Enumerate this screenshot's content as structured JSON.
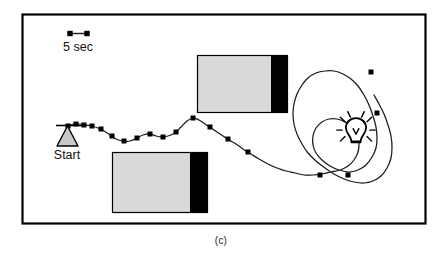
{
  "figure": {
    "caption": "(c)",
    "panel_border_color": "#000000",
    "background_color": "#ffffff"
  },
  "legend": {
    "scale_bar_label": "5 sec",
    "scale_bar_marker_shape": "square",
    "scale_bar_length_px": 19
  },
  "start_marker": {
    "label": "Start",
    "shape": "triangle",
    "fill_color": "#c9c9c9",
    "stroke_color": "#000000"
  },
  "light_source": {
    "icon_name": "light-bulb-icon",
    "ray_count": 8,
    "stroke_color": "#000000"
  },
  "barriers": [
    {
      "name": "upper-barrier",
      "x": 197,
      "y": 55,
      "width": 91,
      "height": 58,
      "panel_fill": "#d9d9d9",
      "dark_band_fill": "#000000",
      "dark_band_width": 17,
      "stroke_color": "#000000"
    },
    {
      "name": "lower-barrier",
      "x": 112,
      "y": 152,
      "width": 96,
      "height": 61,
      "panel_fill": "#d9d9d9",
      "dark_band_fill": "#000000",
      "dark_band_width": 18,
      "stroke_color": "#000000"
    }
  ],
  "chart_data": {
    "type": "line",
    "title": "",
    "xlabel": "",
    "ylabel": "",
    "grid": false,
    "legend_position": "top-left",
    "series": [
      {
        "name": "robot-trajectory",
        "stroke_color": "#1a1a1a",
        "marker_shape": "square",
        "marker_color": "#000000",
        "marker_size_px": 5,
        "path_points": [
          [
            68,
            126
          ],
          [
            74,
            124
          ],
          [
            80,
            124
          ],
          [
            86,
            125
          ],
          [
            92,
            126
          ],
          [
            98,
            128
          ],
          [
            104,
            131
          ],
          [
            110,
            135
          ],
          [
            116,
            139
          ],
          [
            123,
            141
          ],
          [
            130,
            141
          ],
          [
            137,
            138
          ],
          [
            143,
            135
          ],
          [
            150,
            134
          ],
          [
            156,
            136
          ],
          [
            162,
            137
          ],
          [
            168,
            136
          ],
          [
            175,
            133
          ],
          [
            181,
            127
          ],
          [
            187,
            121
          ],
          [
            193,
            118
          ],
          [
            199,
            120
          ],
          [
            205,
            124
          ],
          [
            211,
            128
          ],
          [
            217,
            132
          ],
          [
            223,
            136
          ],
          [
            229,
            140
          ],
          [
            236,
            144
          ],
          [
            243,
            149
          ],
          [
            251,
            154
          ],
          [
            259,
            159
          ],
          [
            268,
            164
          ],
          [
            277,
            168
          ],
          [
            286,
            171
          ],
          [
            295,
            173
          ],
          [
            304,
            175
          ],
          [
            313,
            175
          ],
          [
            322,
            174
          ],
          [
            331,
            172
          ],
          [
            340,
            170
          ],
          [
            348,
            166
          ],
          [
            354,
            160
          ],
          [
            358,
            152
          ],
          [
            359,
            143
          ],
          [
            357,
            134
          ],
          [
            352,
            127
          ],
          [
            345,
            122
          ],
          [
            337,
            119
          ],
          [
            329,
            119
          ],
          [
            322,
            122
          ],
          [
            316,
            128
          ],
          [
            313,
            136
          ],
          [
            313,
            145
          ],
          [
            316,
            153
          ],
          [
            322,
            160
          ],
          [
            330,
            166
          ],
          [
            339,
            170
          ],
          [
            349,
            172
          ],
          [
            358,
            170
          ],
          [
            366,
            165
          ],
          [
            372,
            157
          ],
          [
            376,
            148
          ],
          [
            377,
            138
          ],
          [
            376,
            127
          ],
          [
            373,
            116
          ],
          [
            369,
            105
          ],
          [
            364,
            95
          ],
          [
            358,
            86
          ],
          [
            351,
            79
          ],
          [
            343,
            74
          ],
          [
            334,
            71
          ],
          [
            325,
            71
          ],
          [
            316,
            73
          ],
          [
            308,
            78
          ],
          [
            302,
            85
          ],
          [
            297,
            94
          ],
          [
            294,
            104
          ],
          [
            293,
            114
          ],
          [
            294,
            124
          ],
          [
            297,
            134
          ],
          [
            302,
            144
          ],
          [
            308,
            153
          ],
          [
            316,
            161
          ],
          [
            325,
            168
          ],
          [
            334,
            174
          ],
          [
            344,
            179
          ],
          [
            354,
            182
          ],
          [
            364,
            183
          ],
          [
            373,
            181
          ],
          [
            381,
            176
          ],
          [
            387,
            168
          ],
          [
            391,
            158
          ],
          [
            392,
            147
          ],
          [
            391,
            136
          ],
          [
            388,
            125
          ],
          [
            384,
            114
          ],
          [
            379,
            104
          ],
          [
            374,
            95
          ]
        ],
        "markers": [
          [
            68,
            126
          ],
          [
            76,
            124
          ],
          [
            84,
            125
          ],
          [
            92,
            126
          ],
          [
            101,
            129
          ],
          [
            112,
            136
          ],
          [
            124,
            141
          ],
          [
            137,
            138
          ],
          [
            150,
            134
          ],
          [
            163,
            137
          ],
          [
            176,
            132
          ],
          [
            193,
            118
          ],
          [
            210,
            127
          ],
          [
            228,
            139
          ],
          [
            248,
            152
          ],
          [
            320,
            175
          ],
          [
            348,
            175
          ],
          [
            371,
            72
          ],
          [
            377,
            113
          ]
        ]
      }
    ]
  }
}
